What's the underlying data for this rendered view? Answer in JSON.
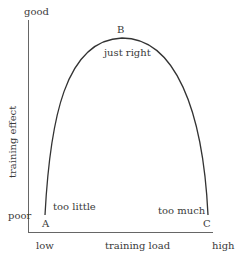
{
  "diagram": {
    "type": "inverted-u curve",
    "y_axis": {
      "label": "training effect",
      "top_label": "good",
      "bottom_label": "poor"
    },
    "x_axis": {
      "label": "training load",
      "left_label": "low",
      "right_label": "high"
    },
    "points": [
      {
        "id": "A",
        "annotation": "too little"
      },
      {
        "id": "B",
        "annotation": "just right"
      },
      {
        "id": "C",
        "annotation": "too much"
      }
    ],
    "colors": {
      "line": "#333333",
      "axis": "#555555",
      "text": "#3a3a3a"
    }
  }
}
